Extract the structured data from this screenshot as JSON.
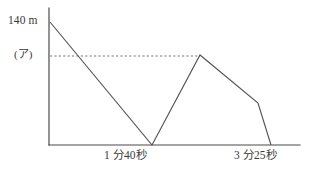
{
  "chart_data": {
    "type": "line",
    "title": "",
    "xlabel": "",
    "ylabel": "",
    "grid": false,
    "legend": "none",
    "axis": {
      "y_top_label": "140 m",
      "y_guide_label": "(ア)",
      "x_tick_labels": [
        "1 分40秒",
        "3 分25秒"
      ]
    },
    "annotations": [
      {
        "name": "guide-line",
        "style": "dashed",
        "description": "horizontal dashed line from y-axis at (ア) level to the second peak"
      }
    ],
    "series": [
      {
        "name": "distance",
        "points": [
          {
            "x_label": "0",
            "y_label": "140 m"
          },
          {
            "x_label": "1 分40秒",
            "y_label": "0"
          },
          {
            "x_label": "",
            "y_label": "(ア)"
          },
          {
            "x_label": "",
            "y_label": ""
          },
          {
            "x_label": "3 分25秒",
            "y_label": "0"
          }
        ]
      }
    ],
    "ylim_labels": [
      "0",
      "140 m"
    ],
    "colors": {
      "axis": "#4a4a4a",
      "data_line": "#555555",
      "guide_line": "#666666",
      "background": "#ffffff",
      "text": "#3a3a3a"
    }
  },
  "geometry": {
    "y_axis": {
      "x": 49,
      "y_top": 8,
      "y_bottom": 145
    },
    "x_axis": {
      "y": 145,
      "x_left": 49,
      "x_right": 300
    },
    "guide_y": 56,
    "data_path": "M 50,22 L 152,145 L 200,55 L 258,103 L 271,145",
    "guide_path": "M 50,56 L 200,56"
  }
}
